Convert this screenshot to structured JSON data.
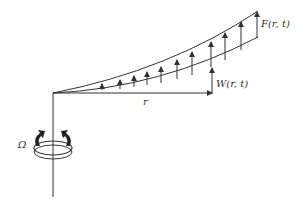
{
  "diagram": {
    "labels": {
      "force": "F(r,  t)",
      "deflection": "W(r,  t)",
      "radius": "r",
      "angular_velocity": "Ω"
    },
    "colors": {
      "stroke": "#333333",
      "background": "#ffffff"
    }
  }
}
